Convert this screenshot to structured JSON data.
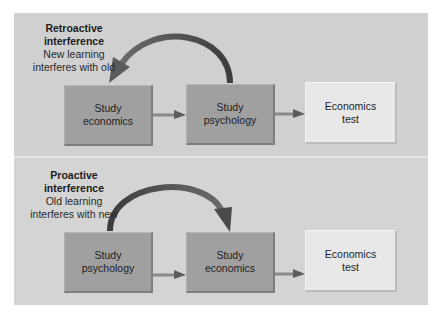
{
  "colors": {
    "panel_background": "#d0d0d0",
    "dark_box": "#a0a0a0",
    "light_box": "#e8e8e8",
    "arrow": "#5a5a5a",
    "curved_arrow": "#4a4a4a",
    "text": "#1c1c1c"
  },
  "panels": [
    {
      "id": "retroactive",
      "label": {
        "title_line1": "Retroactive",
        "title_line2": "interference",
        "desc_line1": "New learning",
        "desc_line2": "interferes with old"
      },
      "boxes": [
        {
          "text": "Study\neconomics",
          "style": "dark"
        },
        {
          "text": "Study\npsychology",
          "style": "dark"
        },
        {
          "text": "Economics\ntest",
          "style": "light"
        }
      ],
      "curved_arrow": {
        "from": "Study psychology",
        "to": "Study economics",
        "direction": "backward"
      }
    },
    {
      "id": "proactive",
      "label": {
        "title_line1": "Proactive",
        "title_line2": "interference",
        "desc_line1": "Old learning",
        "desc_line2": "interferes with new"
      },
      "boxes": [
        {
          "text": "Study\npsychology",
          "style": "dark"
        },
        {
          "text": "Study\neconomics",
          "style": "dark"
        },
        {
          "text": "Economics\ntest",
          "style": "light"
        }
      ],
      "curved_arrow": {
        "from": "Study psychology",
        "to": "Study economics",
        "direction": "forward"
      }
    }
  ]
}
